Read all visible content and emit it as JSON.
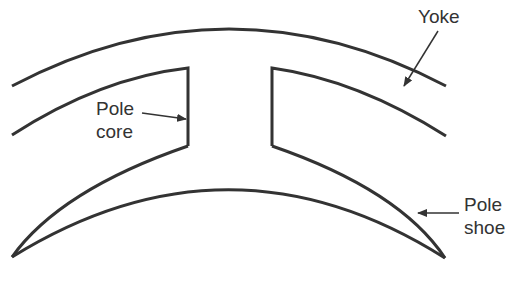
{
  "diagram": {
    "line_color": "#333333",
    "background": "#ffffff",
    "labels": {
      "yoke": "Yoke",
      "pole_core_line1": "Pole",
      "pole_core_line2": "core",
      "pole_shoe_line1": "Pole",
      "pole_shoe_line2": "shoe"
    },
    "parts": [
      "yoke",
      "pole-core",
      "pole-shoe"
    ]
  }
}
